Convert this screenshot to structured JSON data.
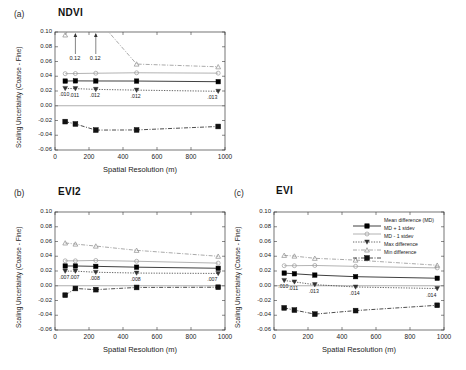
{
  "figure": {
    "axis_labels": {
      "y": "Scaling Uncertainty (Coarse - Fine)",
      "x": "Spatial Resolution (m)"
    },
    "y_ticks": [
      "0.10",
      "0.08",
      "0.06",
      "0.04",
      "0.02",
      "0.00",
      "-0.02",
      "-0.04",
      "-0.06"
    ],
    "x_ticks": [
      "0",
      "200",
      "400",
      "600",
      "800",
      "1000"
    ],
    "colors": {
      "mean": "#000000",
      "plus_stdev": "#9a9a9a",
      "minus_stdev": "#333333",
      "max": "#8c8c8c",
      "min": "#111111",
      "axis": "#3a3a3a"
    }
  },
  "legend": {
    "items": [
      {
        "label": "Mean difference (MD)",
        "marker": "filled-square",
        "dash": "solid"
      },
      {
        "label": "MD + 1 stdev",
        "marker": "open-circle",
        "dash": "solid"
      },
      {
        "label": "MD - 1 stdev",
        "marker": "filled-triangle-down",
        "dash": "dotted"
      },
      {
        "label": "Max difference",
        "marker": "open-triangle-up",
        "dash": "dashdot"
      },
      {
        "label": "Min difference",
        "marker": "filled-square",
        "dash": "dashdot"
      }
    ]
  },
  "chart_data": [
    {
      "type": "line",
      "panel": "(a)",
      "title": "NDVI",
      "xlabel": "Spatial Resolution (m)",
      "ylabel": "Scaling Uncertainty (Coarse - Fine)",
      "xlim": [
        0,
        1000
      ],
      "ylim": [
        -0.06,
        0.1
      ],
      "grid": false,
      "x": [
        60,
        120,
        240,
        480,
        960
      ],
      "series": [
        {
          "name": "Mean difference (MD)",
          "values": [
            0.0335,
            0.0337,
            0.0336,
            0.0335,
            0.0326
          ]
        },
        {
          "name": "MD + 1 stdev",
          "values": [
            0.0435,
            0.0437,
            0.0441,
            0.0447,
            0.0442
          ]
        },
        {
          "name": "MD - 1 stdev",
          "values": [
            0.0235,
            0.0232,
            0.0222,
            0.0212,
            0.0196
          ]
        },
        {
          "name": "Max difference",
          "values": [
            0.096,
            0.12,
            0.12,
            0.0565,
            0.0528
          ]
        },
        {
          "name": "Min difference",
          "values": [
            -0.0215,
            -0.0247,
            -0.033,
            -0.0328,
            -0.0281
          ]
        }
      ],
      "data_labels": [
        ".010",
        ".011",
        ".012",
        ".012",
        ".013"
      ],
      "annotations": [
        {
          "text": "0.12",
          "x": 120,
          "note": "off-scale max difference, arrow points above axis"
        },
        {
          "text": "0.12",
          "x": 240,
          "note": "off-scale max difference, arrow points above axis"
        }
      ]
    },
    {
      "type": "line",
      "panel": "(b)",
      "title": "EVI2",
      "xlabel": "Spatial Resolution (m)",
      "ylabel": "Scaling Uncertainty (Coarse - Fine)",
      "xlim": [
        0,
        1000
      ],
      "ylim": [
        -0.06,
        0.1
      ],
      "grid": false,
      "x": [
        60,
        120,
        240,
        480,
        960
      ],
      "series": [
        {
          "name": "Mean difference (MD)",
          "values": [
            0.0268,
            0.0268,
            0.0263,
            0.0252,
            0.0237
          ]
        },
        {
          "name": "MD + 1 stdev",
          "values": [
            0.0338,
            0.0338,
            0.0343,
            0.0332,
            0.0307
          ]
        },
        {
          "name": "MD - 1 stdev",
          "values": [
            0.0198,
            0.0198,
            0.0183,
            0.0172,
            0.0167
          ]
        },
        {
          "name": "Max difference",
          "values": [
            0.058,
            0.0565,
            0.0538,
            0.048,
            0.04
          ]
        },
        {
          "name": "Min difference",
          "values": [
            -0.0128,
            -0.0037,
            -0.0053,
            -0.0023,
            -0.002
          ]
        }
      ],
      "data_labels": [
        ".007",
        ".007",
        ".008",
        ".008",
        ".007"
      ],
      "annotations": []
    },
    {
      "type": "line",
      "panel": "(c)",
      "title": "EVI",
      "xlabel": "Spatial Resolution (m)",
      "ylabel": "Scaling Uncertainty (Coarse - Fine)",
      "xlim": [
        0,
        1000
      ],
      "ylim": [
        -0.06,
        0.1
      ],
      "grid": false,
      "x": [
        60,
        120,
        240,
        480,
        960
      ],
      "series": [
        {
          "name": "Mean difference (MD)",
          "values": [
            0.0172,
            0.0162,
            0.0145,
            0.0123,
            0.0102
          ]
        },
        {
          "name": "MD + 1 stdev",
          "values": [
            0.0272,
            0.0272,
            0.0275,
            0.0263,
            0.0242
          ]
        },
        {
          "name": "MD - 1 stdev",
          "values": [
            0.0072,
            0.0052,
            0.0015,
            -0.0017,
            -0.0038
          ]
        },
        {
          "name": "Max difference",
          "values": [
            0.0412,
            0.0402,
            0.0372,
            0.0348,
            0.0278
          ]
        },
        {
          "name": "Min difference",
          "values": [
            -0.03,
            -0.033,
            -0.0385,
            -0.0337,
            -0.0265
          ]
        }
      ],
      "data_labels": [
        ".010",
        ".011",
        ".013",
        ".014",
        ".014"
      ],
      "annotations": []
    }
  ]
}
